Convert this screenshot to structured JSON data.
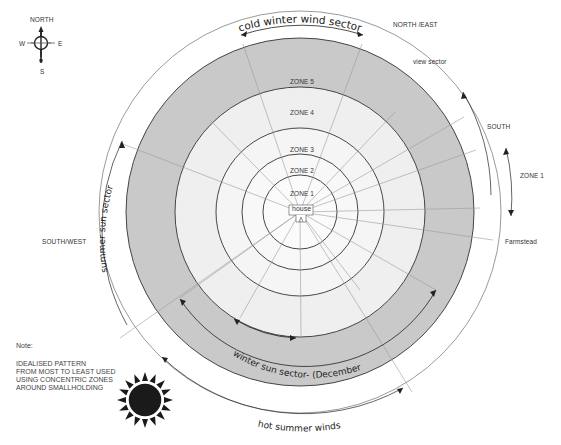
{
  "compass": {
    "north": "NORTH",
    "south": "S",
    "east": "E",
    "west": "W"
  },
  "zones": [
    {
      "label": "ZONE 1",
      "color": "#fbfbfb"
    },
    {
      "label": "ZONE 2",
      "color": "#f8f8f8"
    },
    {
      "label": "ZONE 3",
      "color": "#f5f5f5"
    },
    {
      "label": "ZONE 4",
      "color": "#efefef"
    },
    {
      "label": "ZONE 5",
      "color": "#c9c9c9"
    }
  ],
  "center_label": "house",
  "directions": {
    "north_east": "NORTH /EAST",
    "south": "SOUTH",
    "south_west": "SOUTH/WEST"
  },
  "annotations": {
    "cold_winter_wind": "cold winter wind sector",
    "view_sector": "view sector",
    "zone1_side": "ZONE 1",
    "farmstead": "Farmstead",
    "summer_sun": "summer sun sector",
    "winter_sun": "winter sun sector- (December)",
    "hot_summer_winds": "hot summer winds"
  },
  "note": {
    "title": "Note:",
    "lines": [
      "IDEALISED PATTERN",
      "FROM MOST TO LEAST USED",
      "USING CONCENTRIC ZONES",
      "AROUND SMALLHOLDING"
    ]
  },
  "colors": {
    "outline": "#333333",
    "radial": "#9a9a9a",
    "zone5": "#c9c9c9",
    "sun": "#1a1a1a"
  }
}
